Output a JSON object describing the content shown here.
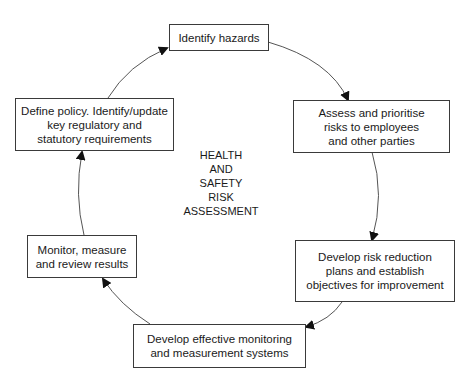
{
  "diagram": {
    "type": "cycle",
    "center_label": [
      "HEALTH",
      "AND",
      "SAFETY",
      "RISK",
      "ASSESSMENT"
    ],
    "line_color": "#555555",
    "box_border_color": "#3a3a3a",
    "nodes": [
      {
        "id": "identify-hazards",
        "lines": [
          "Identify hazards"
        ]
      },
      {
        "id": "assess-prioritise",
        "lines": [
          "Assess and prioritise",
          "risks to employees",
          "and other parties"
        ]
      },
      {
        "id": "develop-risk-reduction",
        "lines": [
          "Develop risk reduction",
          "plans and establish",
          "objectives for improvement"
        ]
      },
      {
        "id": "develop-monitoring",
        "lines": [
          "Develop effective monitoring",
          "and measurement systems"
        ]
      },
      {
        "id": "monitor-review",
        "lines": [
          "Monitor, measure",
          "and review results"
        ]
      },
      {
        "id": "define-policy",
        "lines": [
          "Define policy. Identify/update",
          "key regulatory and",
          "statutory requirements"
        ]
      }
    ],
    "edges": [
      {
        "from": "identify-hazards",
        "to": "assess-prioritise"
      },
      {
        "from": "assess-prioritise",
        "to": "develop-risk-reduction"
      },
      {
        "from": "develop-risk-reduction",
        "to": "develop-monitoring"
      },
      {
        "from": "develop-monitoring",
        "to": "monitor-review"
      },
      {
        "from": "monitor-review",
        "to": "define-policy"
      },
      {
        "from": "define-policy",
        "to": "identify-hazards"
      }
    ]
  }
}
